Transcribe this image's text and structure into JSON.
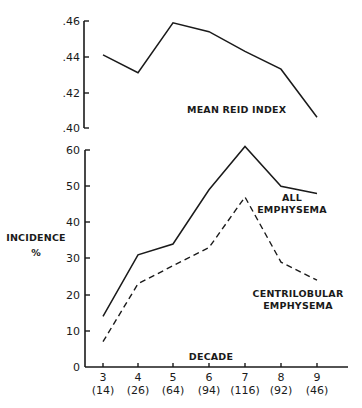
{
  "chart_data": [
    {
      "type": "line",
      "title": "",
      "panel": "top",
      "xlabel": "",
      "ylabel": "",
      "x": [
        3,
        4,
        5,
        6,
        7,
        8,
        9
      ],
      "ylim": [
        0.4,
        0.46
      ],
      "yticks": [
        ".40",
        ".42",
        ".44",
        ".46"
      ],
      "series": [
        {
          "name": "MEAN REID INDEX",
          "style": "solid",
          "values": [
            0.441,
            0.431,
            0.459,
            0.454,
            0.443,
            0.433,
            0.406
          ]
        }
      ],
      "grid": false
    },
    {
      "type": "line",
      "title": "",
      "panel": "bottom",
      "xlabel": "DECADE",
      "ylabel": "INCIDENCE %",
      "x": [
        3,
        4,
        5,
        6,
        7,
        8,
        9
      ],
      "categories": [
        "3 (14)",
        "4 (26)",
        "5 (64)",
        "6 (94)",
        "7 (116)",
        "8 (92)",
        "9 (46)"
      ],
      "ylim": [
        0,
        60
      ],
      "yticks": [
        "0",
        "10",
        "20",
        "30",
        "40",
        "50",
        "60"
      ],
      "series": [
        {
          "name": "ALL EMPHYSEMA",
          "style": "solid",
          "values": [
            14,
            31,
            34,
            49,
            61,
            50,
            48
          ]
        },
        {
          "name": "CENTRILOBULAR EMPHYSEMA",
          "style": "dashed",
          "values": [
            7,
            23,
            28,
            33,
            47,
            29,
            24
          ]
        }
      ],
      "grid": false,
      "legend": "inline labels near line ends"
    }
  ],
  "labels": {
    "top_ticks": [
      ".46",
      ".44",
      ".42",
      ".40"
    ],
    "top_series_label": "MEAN REID INDEX",
    "bottom_ticks": [
      "60",
      "50",
      "40",
      "30",
      "20",
      "10",
      "0"
    ],
    "ylabel_line1": "INCIDENCE",
    "ylabel_line2": "%",
    "all_label_line1": "ALL",
    "all_label_line2": "EMPHYSEMA",
    "centri_label_line1": "CENTRILOBULAR",
    "centri_label_line2": "EMPHYSEMA",
    "xlabel": "DECADE",
    "decades": [
      "3",
      "4",
      "5",
      "6",
      "7",
      "8",
      "9"
    ],
    "counts": [
      "(14)",
      "(26)",
      "(64)",
      "(94)",
      "(116)",
      "(92)",
      "(46)"
    ]
  },
  "colors": {
    "ink": "#1a1a1a",
    "background": "#ffffff"
  }
}
